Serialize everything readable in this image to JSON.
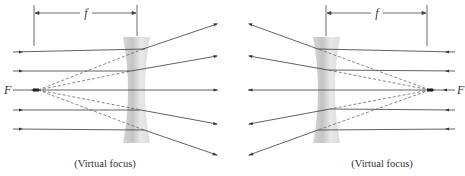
{
  "diagram": {
    "colors": {
      "ray": "#3a3a3a",
      "virtual_ray": "#555555",
      "lens_light": "#f2f2f2",
      "lens_dark": "#cfcfcf",
      "text": "#333333"
    },
    "left": {
      "focal_label": "f",
      "focus_label": "F",
      "caption": "(Virtual focus)",
      "light_direction": "left-to-right",
      "ray_count": 5
    },
    "right": {
      "focal_label": "f",
      "focus_label": "F",
      "caption": "(Virtual focus)",
      "light_direction": "right-to-left",
      "ray_count": 5
    }
  }
}
